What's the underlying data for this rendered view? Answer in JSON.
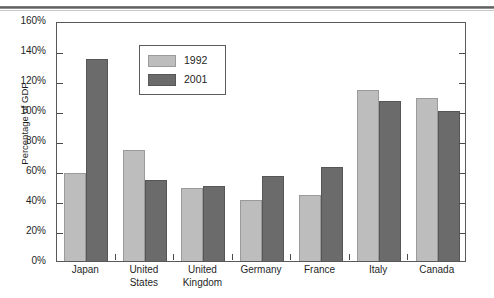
{
  "page": {
    "header_fragment": "",
    "header_rule": "horizontal-rule"
  },
  "chart_data": {
    "type": "bar",
    "title": "",
    "subtitle": "",
    "xlabel": "",
    "ylabel": "Percentage of GDP",
    "ylim": [
      0,
      160
    ],
    "ytick_step": 20,
    "ytick_labels": [
      "0%",
      "20%",
      "40%",
      "60%",
      "80%",
      "100%",
      "120%",
      "140%",
      "160%"
    ],
    "ytick_values": [
      0,
      20,
      40,
      60,
      80,
      100,
      120,
      140,
      160
    ],
    "grid": false,
    "legend_position": "upper-left-inside",
    "value_unit": "percent",
    "categories": [
      "Japan",
      "United States",
      "United Kingdom",
      "Germany",
      "France",
      "Italy",
      "Canada"
    ],
    "category_label_lines": [
      [
        "Japan"
      ],
      [
        "United",
        "States"
      ],
      [
        "United",
        "Kingdom"
      ],
      [
        "Germany"
      ],
      [
        "France"
      ],
      [
        "Italy"
      ],
      [
        "Canada"
      ]
    ],
    "series": [
      {
        "name": "1992",
        "color": "#bdbdbd",
        "values": [
          59,
          74,
          49,
          41,
          44,
          114,
          109
        ]
      },
      {
        "name": "2001",
        "color": "#6b6b6b",
        "values": [
          135,
          54,
          50,
          57,
          63,
          107,
          100
        ]
      }
    ]
  },
  "legend": {
    "items": [
      {
        "label": "1992",
        "series_index": 0
      },
      {
        "label": "2001",
        "series_index": 1
      }
    ]
  },
  "colors": {
    "series_1992": "#bdbdbd",
    "series_2001": "#6b6b6b",
    "axis": "#595959",
    "text": "#1f1f1f",
    "background": "#ffffff"
  }
}
